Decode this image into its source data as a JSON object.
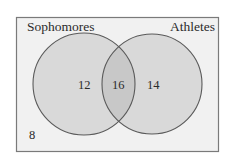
{
  "diagram": {
    "type": "venn",
    "sets": [
      {
        "label": "Sophomores",
        "only_count": "12"
      },
      {
        "label": "Athletes",
        "only_count": "14"
      }
    ],
    "intersection_count": "16",
    "outside_count": "8"
  },
  "colors": {
    "background": "#ffffff",
    "universe_fill": "#f1f1f1",
    "universe_stroke": "#7a7a7a",
    "circle_fill": "#d9d9d9",
    "circle_stroke": "#5a5a5a",
    "intersection_fill": "#c8c8c8",
    "text": "#2b2b2b"
  }
}
